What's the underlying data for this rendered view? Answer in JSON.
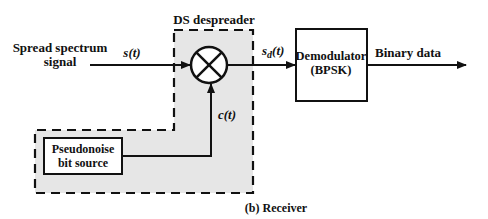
{
  "diagram": {
    "caption": "(b) Receiver",
    "input_label_line1": "Spread spectrum",
    "input_label_line2": "signal",
    "signal_s": "s(t)",
    "signal_sd_main": "s",
    "signal_sd_sub": "d",
    "signal_sd_tail": "(t)",
    "signal_c": "c(t)",
    "despreader_title": "DS despreader",
    "demodulator_line1": "Demodulator",
    "demodulator_line2": "(BPSK)",
    "pn_line1": "Pseudonoise",
    "pn_line2": "bit source",
    "output_label": "Binary data",
    "colors": {
      "shade": "#e6e6e6",
      "stroke": "#111111"
    }
  }
}
